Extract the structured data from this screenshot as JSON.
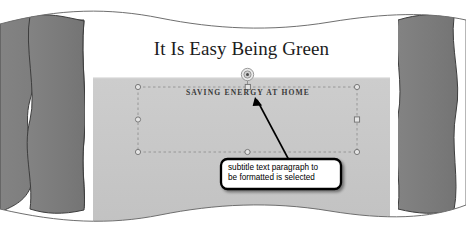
{
  "figure": {
    "kind": "screenshot-excerpt"
  },
  "slide": {
    "title": "It Is Easy Being Green",
    "subtitle": "SAVING ENERGY AT HOME",
    "title_band_color": "#ffffff",
    "body_band_color": "#c8c8c8"
  },
  "selection": {
    "name": "subtitle-placeholder",
    "rotation_handle": "rotate-handle",
    "handles": [
      {
        "id": "handle-top-left",
        "shape": "circle"
      },
      {
        "id": "handle-top-center",
        "shape": "square"
      },
      {
        "id": "handle-top-right",
        "shape": "circle"
      },
      {
        "id": "handle-middle-left",
        "shape": "circle"
      },
      {
        "id": "handle-middle-right",
        "shape": "square"
      },
      {
        "id": "handle-bottom-left",
        "shape": "circle"
      },
      {
        "id": "handle-bottom-center",
        "shape": "circle"
      },
      {
        "id": "handle-bottom-right",
        "shape": "circle"
      }
    ]
  },
  "callout": {
    "line1": "subtitle text paragraph to",
    "line2": "be formatted is selected",
    "border_color": "#000000",
    "fill_color": "#ffffff"
  },
  "torn_edges": {
    "panel_color": "#7e7e7e",
    "outline_color": "#3d3d3d"
  }
}
